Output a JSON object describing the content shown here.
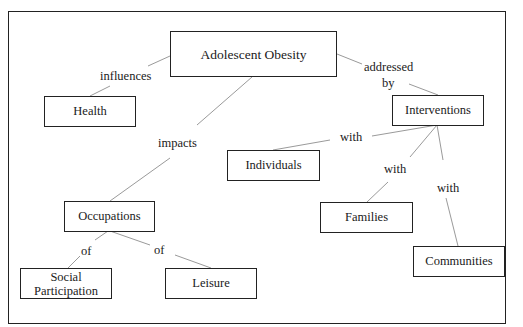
{
  "diagram": {
    "type": "concept-map",
    "nodes": {
      "root": "Adolescent Obesity",
      "health": "Health",
      "interventions": "Interventions",
      "individuals": "Individuals",
      "occupations": "Occupations",
      "families": "Families",
      "communities": "Communities",
      "social_participation": "Social Participation",
      "leisure": "Leisure"
    },
    "edges": {
      "influences": "influences",
      "addressed_by_1": "addressed",
      "addressed_by_2": "by",
      "impacts": "impacts",
      "with_individuals": "with",
      "with_families": "with",
      "with_communities": "with",
      "of_social": "of",
      "of_leisure": "of"
    },
    "colors": {
      "line": "#999999",
      "border": "#222222",
      "text": "#1a1a1a"
    }
  }
}
